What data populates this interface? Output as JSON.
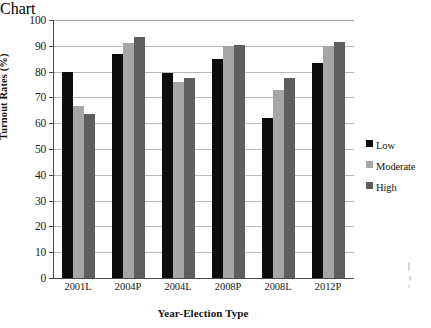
{
  "chart_data": {
    "type": "bar",
    "title": "",
    "xlabel": "Year-Election Type",
    "ylabel": "Turnout Rates (%)",
    "categories": [
      "2001L",
      "2004P",
      "2004L",
      "2008P",
      "2008L",
      "2012P"
    ],
    "series": [
      {
        "name": "Low",
        "color": "#0d0d0d",
        "values": [
          80.0,
          87.0,
          79.5,
          85.0,
          62.0,
          83.5
        ]
      },
      {
        "name": "Moderate",
        "color": "#a6a6a6",
        "values": [
          66.5,
          91.0,
          76.0,
          90.0,
          73.0,
          90.0
        ]
      },
      {
        "name": "High",
        "color": "#5e5e5e",
        "values": [
          63.5,
          93.5,
          77.5,
          90.5,
          77.5,
          91.5
        ]
      }
    ],
    "ylim": [
      0,
      100
    ],
    "yticks": [
      0,
      10,
      20,
      30,
      40,
      50,
      60,
      70,
      80,
      90,
      100
    ],
    "ytick_labels": [
      "0",
      "10",
      "20",
      "30",
      "40",
      "50",
      "60",
      "70",
      "80",
      "90",
      "100"
    ],
    "grid": true,
    "grid_axis": "y",
    "legend_position": "right"
  }
}
